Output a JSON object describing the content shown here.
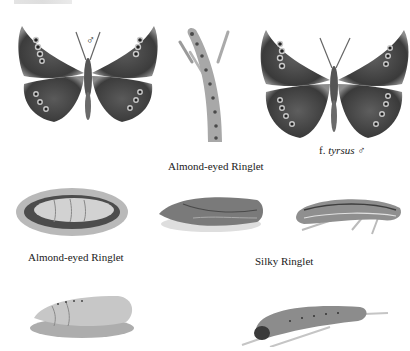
{
  "plate": {
    "header_text": "",
    "colors": {
      "background": "#ffffff",
      "wing_dark": "#3a3a3a",
      "wing_mid": "#5c5c5c",
      "eyespot_ring": "#c9c9c9",
      "pupa_light": "#d9d9d9",
      "caption_text": "#1a1a1a"
    }
  },
  "figures": [
    {
      "id": "butterfly-male",
      "label": "",
      "symbol": "♂"
    },
    {
      "id": "caterpillar-almond-eyed-climbing",
      "label": ""
    },
    {
      "id": "butterfly-f-tyrsus-male",
      "label_prefix": "f. ",
      "label_italic": "tyrsus",
      "symbol": "♂"
    },
    {
      "id": "pupa-almond-eyed-1",
      "label": ""
    },
    {
      "id": "pupa-silky-1",
      "label": ""
    },
    {
      "id": "caterpillar-silky-1",
      "label": ""
    },
    {
      "id": "pupa-2",
      "label": ""
    },
    {
      "id": "caterpillar-2",
      "label": ""
    }
  ],
  "captions": {
    "almond_eyed_top": "Almond-eyed Ringlet",
    "tyrsus_prefix": "f. ",
    "tyrsus_italic": "tyrsus",
    "tyrsus_symbol": "♂",
    "male_symbol": "♂",
    "almond_eyed_left": "Almond-eyed Ringlet",
    "silky": "Silky Ringlet"
  }
}
